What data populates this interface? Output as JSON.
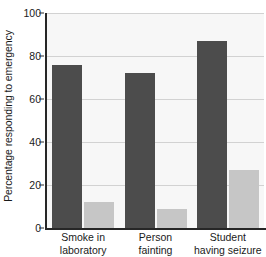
{
  "chart_data": {
    "type": "bar",
    "title": "",
    "subtitle": "",
    "xlabel": "",
    "ylabel": "Percentage responding to emergency",
    "ylim": [
      0,
      100
    ],
    "yticks": [
      0,
      20,
      40,
      60,
      80,
      100
    ],
    "ytick_labels": [
      "0",
      "20",
      "40",
      "60",
      "80",
      "100"
    ],
    "grid": "horizontal",
    "legend_position": "none",
    "categories": [
      "Smoke in laboratory",
      "Person fainting",
      "Student having seizure"
    ],
    "category_lines": [
      [
        "Smoke in",
        "laboratory"
      ],
      [
        "Person",
        "fainting"
      ],
      [
        "Student",
        "having seizure"
      ]
    ],
    "series": [
      {
        "name": "Alone",
        "color": "#4c4c4c",
        "values": [
          76,
          72,
          87
        ]
      },
      {
        "name": "In group",
        "color": "#c6c6c6",
        "values": [
          12,
          9,
          27
        ]
      }
    ],
    "colors": {
      "primary_bar": "#4c4c4c",
      "secondary_bar": "#c6c6c6",
      "plot_background": "#f7f7f7",
      "gridline": "#d2d2d2",
      "axis_line": "#262626",
      "text": "#1a1a1a",
      "page_background": "#ffffff"
    }
  }
}
